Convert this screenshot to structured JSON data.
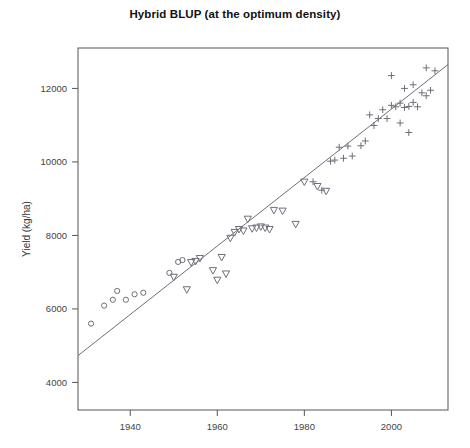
{
  "chart_data": {
    "type": "scatter",
    "title": "Hybrid BLUP (at the optimum density)",
    "xlabel": "",
    "ylabel": "Yield (kg/ha)",
    "xlim": [
      1928,
      2013
    ],
    "ylim": [
      3250,
      13100
    ],
    "xticks": [
      1940,
      1960,
      1980,
      2000
    ],
    "yticks": [
      4000,
      6000,
      8000,
      10000,
      12000
    ],
    "xtick_labels": [
      "1940",
      "1960",
      "1980",
      "2000"
    ],
    "ytick_labels": [
      "4000",
      "6000",
      "8000",
      "10000",
      "12000"
    ],
    "grid": false,
    "legend": "none",
    "marker_color": "#6e6e78",
    "line_color": "#6e6e78",
    "box_color": "#555555",
    "trendline": {
      "type": "linear",
      "x": [
        1928,
        2013
      ],
      "y": [
        4730,
        12650
      ]
    },
    "series": [
      {
        "name": "era-1 (circles)",
        "marker": "circle",
        "points": [
          [
            1931,
            5600
          ],
          [
            1934,
            6090
          ],
          [
            1936,
            6250
          ],
          [
            1937,
            6490
          ],
          [
            1939,
            6250
          ],
          [
            1941,
            6400
          ],
          [
            1943,
            6440
          ],
          [
            1949,
            6980
          ],
          [
            1951,
            7280
          ],
          [
            1952,
            7330
          ]
        ]
      },
      {
        "name": "era-2 (triangles)",
        "marker": "triangle-down",
        "points": [
          [
            1950,
            6860
          ],
          [
            1953,
            6520
          ],
          [
            1954,
            7260
          ],
          [
            1955,
            7290
          ],
          [
            1956,
            7370
          ],
          [
            1959,
            7040
          ],
          [
            1960,
            6780
          ],
          [
            1961,
            7400
          ],
          [
            1962,
            6950
          ],
          [
            1963,
            7920
          ],
          [
            1964,
            8080
          ],
          [
            1965,
            8160
          ],
          [
            1966,
            8120
          ],
          [
            1967,
            8440
          ],
          [
            1968,
            8180
          ],
          [
            1969,
            8200
          ],
          [
            1970,
            8230
          ],
          [
            1971,
            8200
          ],
          [
            1972,
            8160
          ],
          [
            1973,
            8680
          ],
          [
            1975,
            8660
          ],
          [
            1978,
            8300
          ],
          [
            1980,
            9450
          ],
          [
            1983,
            9330
          ],
          [
            1985,
            9200
          ]
        ]
      },
      {
        "name": "era-3 (plus)",
        "marker": "plus",
        "points": [
          [
            1982,
            9460
          ],
          [
            1984,
            9230
          ],
          [
            1986,
            10020
          ],
          [
            1987,
            10050
          ],
          [
            1988,
            10400
          ],
          [
            1989,
            10100
          ],
          [
            1990,
            10430
          ],
          [
            1991,
            10160
          ],
          [
            1993,
            10440
          ],
          [
            1994,
            10570
          ],
          [
            1995,
            11280
          ],
          [
            1996,
            10990
          ],
          [
            1997,
            11180
          ],
          [
            1998,
            11420
          ],
          [
            1999,
            11180
          ],
          [
            2000,
            12350
          ],
          [
            2000,
            11540
          ],
          [
            2001,
            11500
          ],
          [
            2002,
            11600
          ],
          [
            2002,
            11060
          ],
          [
            2003,
            11480
          ],
          [
            2003,
            12000
          ],
          [
            2004,
            11510
          ],
          [
            2004,
            10800
          ],
          [
            2005,
            11620
          ],
          [
            2005,
            12100
          ],
          [
            2006,
            11500
          ],
          [
            2007,
            11880
          ],
          [
            2008,
            12560
          ],
          [
            2008,
            11800
          ],
          [
            2009,
            11950
          ],
          [
            2010,
            12480
          ]
        ]
      }
    ]
  },
  "axes": {
    "ylabel_text": "Yield (kg/ha)"
  }
}
